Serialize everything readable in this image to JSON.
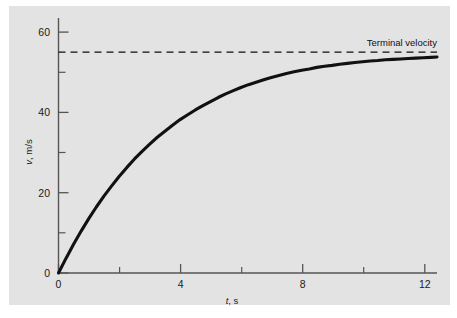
{
  "figure": {
    "background_color": "#ffffff",
    "panel_color": "#e3e3e3",
    "curve_color": "#111111",
    "axis_color": "#555555",
    "text_color": "#1a1a1a"
  },
  "chart_data": {
    "type": "line",
    "title": "",
    "xlabel": "t, s",
    "xlabel_symbol": "t",
    "xlabel_unit": ", s",
    "ylabel": "v, m/s",
    "ylabel_symbol": "v",
    "ylabel_unit": ", m/s",
    "xlim": [
      0,
      12.45
    ],
    "ylim": [
      0,
      63.5
    ],
    "grid": false,
    "legend_position": "none",
    "x_major_ticks": [
      0,
      4,
      8,
      12
    ],
    "x_major_tick_labels": [
      "0",
      "4",
      "8",
      "12"
    ],
    "x_minor_ticks": [
      2,
      6,
      10
    ],
    "y_major_ticks": [
      0,
      20,
      40,
      60
    ],
    "y_major_tick_labels": [
      "0",
      "20",
      "40",
      "60"
    ],
    "y_minor_ticks": [
      10,
      30,
      50
    ],
    "series": [
      {
        "name": "velocity",
        "style": "solid",
        "color": "#111111",
        "model": "v(t) = 51 * (1 - exp(-t/3.3))",
        "x": [
          0,
          0.25,
          0.5,
          0.75,
          1,
          1.25,
          1.5,
          1.75,
          2,
          2.25,
          2.5,
          2.75,
          3,
          3.25,
          3.5,
          3.75,
          4,
          4.25,
          4.5,
          4.75,
          5,
          5.25,
          5.5,
          5.75,
          6,
          6.25,
          6.5,
          6.75,
          7,
          7.25,
          7.5,
          7.75,
          8,
          8.25,
          8.5,
          8.75,
          9,
          9.25,
          9.5,
          9.75,
          10,
          10.25,
          10.5,
          10.75,
          11,
          11.25,
          11.5,
          11.75,
          12,
          12.25,
          12.45
        ],
        "y": [
          0.0,
          3.7,
          7.2,
          10.5,
          13.6,
          16.5,
          19.2,
          21.7,
          24.1,
          26.3,
          28.4,
          30.3,
          32.1,
          33.8,
          35.3,
          36.8,
          38.2,
          39.4,
          40.6,
          41.7,
          42.7,
          43.7,
          44.6,
          45.4,
          46.2,
          46.9,
          47.5,
          48.1,
          48.7,
          49.2,
          49.7,
          50.1,
          50.5,
          50.8,
          51.2,
          51.5,
          51.7,
          52.0,
          52.2,
          52.4,
          52.6,
          52.8,
          52.9,
          53.1,
          53.2,
          53.3,
          53.4,
          53.5,
          53.6,
          53.7,
          53.8
        ]
      }
    ],
    "reference_lines": [
      {
        "name": "terminal-velocity",
        "label": "Terminal velocity",
        "orientation": "horizontal",
        "value": 55.0,
        "style": "dashed",
        "color": "#111111"
      }
    ],
    "annotations": [
      {
        "name": "terminal-velocity-label",
        "text": "Terminal velocity",
        "x": 9.0,
        "y": 58.0
      }
    ]
  }
}
